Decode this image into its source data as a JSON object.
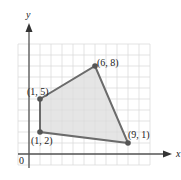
{
  "chart_data": {
    "type": "scatter",
    "title": "",
    "xlabel": "x",
    "ylabel": "y",
    "origin_label": "0",
    "xlim": [
      -1,
      11
    ],
    "ylim": [
      -1,
      10
    ],
    "grid": true,
    "polygon": {
      "vertices": [
        {
          "x": 1,
          "y": 2,
          "label": "(1, 2)"
        },
        {
          "x": 1,
          "y": 5,
          "label": "(1, 5)"
        },
        {
          "x": 6,
          "y": 8,
          "label": "(6, 8)"
        },
        {
          "x": 9,
          "y": 1,
          "label": "(9, 1)"
        }
      ],
      "fill": "#dcdcdc",
      "stroke": "#6b6b6b"
    }
  },
  "colors": {
    "grid": "#dcdcdc",
    "axis": "#555555",
    "fill": "#dcdcdc",
    "edge": "#6b6b6b"
  }
}
